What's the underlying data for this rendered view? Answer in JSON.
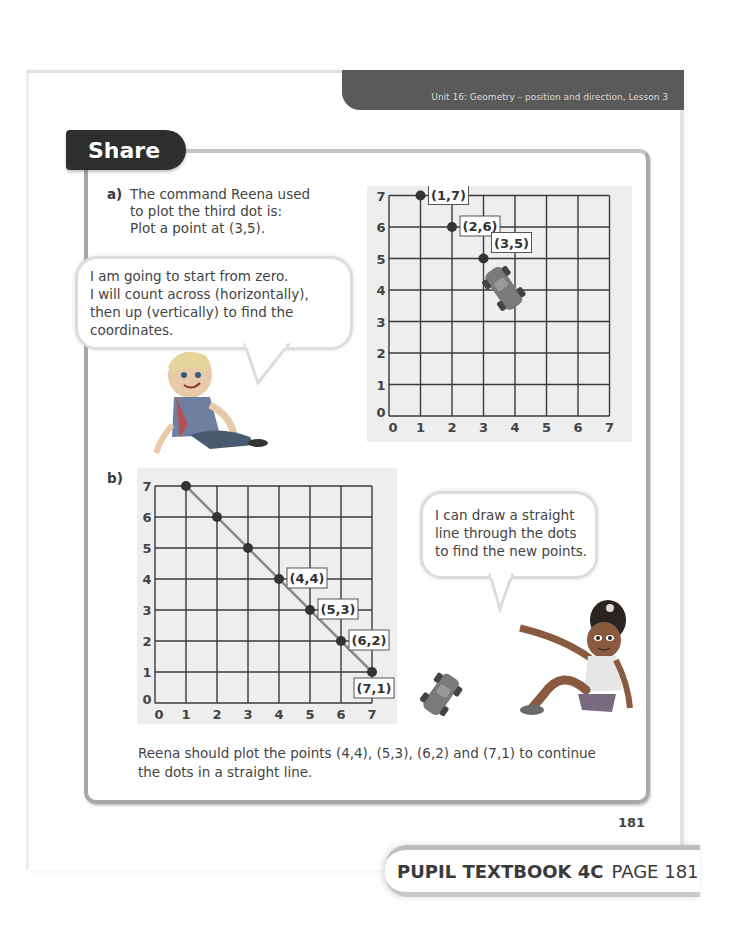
{
  "header": {
    "unit_banner": "Unit 16: Geometry – position and direction, Lesson 3"
  },
  "section": {
    "title": "Share"
  },
  "part_a": {
    "label": "a)",
    "lines": [
      "The command Reena used",
      "to plot the third dot is:",
      "Plot a point at (3,5)."
    ],
    "bubble_lines": [
      "I am going to start from zero.",
      "I will count across (horizontally),",
      "then up (vertically) to find the",
      "coordinates."
    ],
    "grid": {
      "x_ticks": [
        "0",
        "1",
        "2",
        "3",
        "4",
        "5",
        "6",
        "7"
      ],
      "y_ticks": [
        "0",
        "1",
        "2",
        "3",
        "4",
        "5",
        "6",
        "7"
      ],
      "points": [
        {
          "x": 1,
          "y": 7,
          "label": "(1,7)"
        },
        {
          "x": 2,
          "y": 6,
          "label": "(2,6)"
        },
        {
          "x": 3,
          "y": 5,
          "label": "(3,5)"
        }
      ],
      "decoration": "toy-car-icon"
    }
  },
  "part_b": {
    "label": "b)",
    "bubble_lines": [
      "I can draw a straight",
      "line through the dots",
      "to find the new points."
    ],
    "grid": {
      "x_ticks": [
        "0",
        "1",
        "2",
        "3",
        "4",
        "5",
        "6",
        "7"
      ],
      "y_ticks": [
        "0",
        "1",
        "2",
        "3",
        "4",
        "5",
        "6",
        "7"
      ],
      "points": [
        {
          "x": 1,
          "y": 7,
          "label": ""
        },
        {
          "x": 2,
          "y": 6,
          "label": ""
        },
        {
          "x": 3,
          "y": 5,
          "label": ""
        },
        {
          "x": 4,
          "y": 4,
          "label": "(4,4)"
        },
        {
          "x": 5,
          "y": 3,
          "label": "(5,3)"
        },
        {
          "x": 6,
          "y": 2,
          "label": "(6,2)"
        },
        {
          "x": 7,
          "y": 1,
          "label": "(7,1)"
        }
      ],
      "line_from": [
        1,
        7
      ],
      "line_to": [
        7,
        1
      ]
    },
    "answer_lines": [
      "Reena should plot the points (4,4), (5,3), (6,2) and (7,1) to continue",
      "the dots in a straight line."
    ]
  },
  "page_number": "181",
  "footer": {
    "book": "PUPIL TEXTBOOK 4C",
    "page": "PAGE 181"
  },
  "colors": {
    "banner_bg": "#5a5a5a",
    "tab_bg": "#2e2e2e",
    "frame_border": "#a8a8a8",
    "grid_panel_bg": "#eeeeee",
    "grid_line": "#3a3a3a",
    "dot": "#333333",
    "line_b": "#8a8a8a"
  }
}
